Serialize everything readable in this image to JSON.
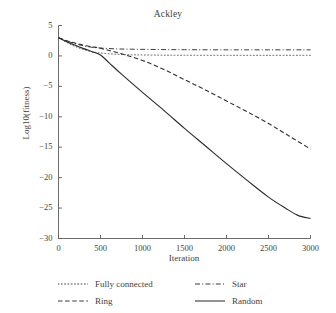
{
  "chart_data": {
    "type": "line",
    "title": "Ackley",
    "xlabel": "Iteration",
    "ylabel": "Log10(fitness)",
    "xlim": [
      0,
      3000
    ],
    "ylim": [
      -30,
      5
    ],
    "xticks": [
      0,
      500,
      1000,
      1500,
      2000,
      2500,
      3000
    ],
    "yticks": [
      5,
      0,
      -5,
      -10,
      -15,
      -20,
      -25,
      -30
    ],
    "xticklabels": [
      "0",
      "500",
      "1000",
      "1500",
      "2000",
      "2500",
      "3000"
    ],
    "yticklabels": [
      "5",
      "0",
      "−5",
      "−10",
      "−15",
      "−20",
      "−25",
      "−30"
    ],
    "grid": false,
    "legend_position": "below-axes",
    "series": [
      {
        "name": "Fully connected",
        "style": "dotted",
        "color": "#545454",
        "x": [
          0,
          100,
          200,
          300,
          400,
          500,
          700,
          900,
          1200,
          1500,
          2000,
          2500,
          3000
        ],
        "values": [
          3.0,
          2.2,
          1.55,
          1.05,
          0.7,
          0.48,
          0.26,
          0.18,
          0.13,
          0.11,
          0.1,
          0.1,
          0.1
        ]
      },
      {
        "name": "Star",
        "style": "dashdot",
        "color": "#3d3d3d",
        "x": [
          0,
          100,
          200,
          300,
          400,
          500,
          700,
          900,
          1200,
          1500,
          2000,
          2500,
          3000
        ],
        "values": [
          3.0,
          2.45,
          2.0,
          1.65,
          1.42,
          1.3,
          1.15,
          1.1,
          1.05,
          1.02,
          1.0,
          1.0,
          1.0
        ]
      },
      {
        "name": "Ring",
        "style": "dashed",
        "color": "#2f2f2f",
        "x": [
          0,
          100,
          200,
          300,
          400,
          500,
          750,
          1000,
          1250,
          1500,
          1750,
          2000,
          2250,
          2500,
          2750,
          3000
        ],
        "values": [
          3.0,
          2.5,
          2.1,
          1.75,
          1.5,
          1.25,
          0.35,
          -0.75,
          -2.2,
          -3.9,
          -5.6,
          -7.4,
          -9.2,
          -11.1,
          -13.2,
          -15.3
        ]
      },
      {
        "name": "Random",
        "style": "solid",
        "color": "#2a2a2a",
        "x": [
          0,
          100,
          200,
          300,
          400,
          500,
          600,
          750,
          1000,
          1250,
          1500,
          1750,
          2000,
          2250,
          2500,
          2700,
          2850,
          3000
        ],
        "values": [
          3.0,
          2.35,
          1.75,
          1.2,
          0.7,
          0.15,
          -1.1,
          -3.0,
          -6.0,
          -8.9,
          -11.9,
          -14.8,
          -17.7,
          -20.5,
          -23.2,
          -25.0,
          -26.2,
          -26.7
        ]
      }
    ]
  },
  "legend": {
    "entries": [
      {
        "label": "Fully connected",
        "style": "dotted"
      },
      {
        "label": "Star",
        "style": "dashdot"
      },
      {
        "label": "Ring",
        "style": "dashed"
      },
      {
        "label": "Random",
        "style": "solid"
      }
    ]
  },
  "colors": {
    "ink": "#3f3f3f",
    "axis": "#5a5a5a",
    "background": "#ffffff"
  }
}
